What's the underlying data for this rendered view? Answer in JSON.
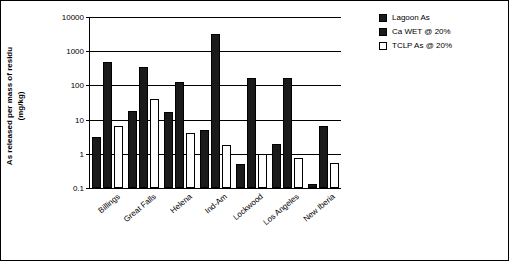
{
  "chart_data": {
    "type": "bar",
    "title": "",
    "xlabel": "",
    "ylabel": "As released per mass of residu (mg/kg)",
    "ylabel_line1": "As released per mass of residu",
    "ylabel_line2": "(mg/kg)",
    "categories": [
      "Billings",
      "Great Falls",
      "Helena",
      "Ind-Am",
      "Lockwood",
      "Los Angeles",
      "New Iberia"
    ],
    "yscale": "log",
    "ylim": [
      0.1,
      10000
    ],
    "yticks": [
      0.1,
      1,
      10,
      100,
      1000,
      10000
    ],
    "ytick_labels": [
      "0.1",
      "1",
      "10",
      "100",
      "1000",
      "10000"
    ],
    "grid": true,
    "legend_position": "top-right",
    "series": [
      {
        "name": "Lagoon As",
        "color": "#1a1a1a",
        "values": [
          3.2,
          18,
          17,
          5.0,
          0.5,
          2.0,
          0.13
        ]
      },
      {
        "name": "Ca WET @ 20%",
        "color": "#1a1a1a",
        "values": [
          480,
          350,
          130,
          3100,
          170,
          160,
          6.5
        ]
      },
      {
        "name": "TCLP As @ 20%",
        "color": "#ffffff",
        "values": [
          6.5,
          40,
          4.2,
          1.8,
          1.0,
          0.75,
          0.55
        ]
      }
    ]
  },
  "legend": {
    "items": [
      {
        "label": "Lagoon As",
        "color": "#1a1a1a"
      },
      {
        "label": "Ca WET @ 20%",
        "color": "#1a1a1a"
      },
      {
        "label": "TCLP As @ 20%",
        "color": "#ffffff"
      }
    ]
  }
}
